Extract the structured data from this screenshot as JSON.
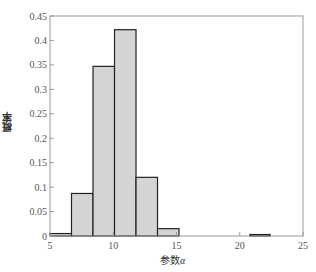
{
  "chart_data": {
    "type": "bar",
    "subtype": "histogram",
    "title": "",
    "xlabel": "参数",
    "xlabel_symbol": "α",
    "ylabel": "概率",
    "xlim": [
      5,
      25
    ],
    "ylim": [
      0,
      0.45
    ],
    "xticks": [
      5,
      10,
      15,
      20,
      25
    ],
    "yticks": [
      0,
      0.05,
      0.1,
      0.15,
      0.2,
      0.25,
      0.3,
      0.35,
      0.4,
      0.45
    ],
    "ytick_labels": [
      "0",
      "0.05",
      "0.1",
      "0.15",
      "0.2",
      "0.25",
      "0.3",
      "0.35",
      "0.4",
      "0.45"
    ],
    "grid": false,
    "legend": null,
    "bin_edges": [
      5,
      6.7,
      8.4,
      10.1,
      11.8,
      13.5,
      15.2,
      20.8,
      22.4
    ],
    "bins": [
      {
        "x0": 5.0,
        "x1": 6.7,
        "value": 0.005
      },
      {
        "x0": 6.7,
        "x1": 8.4,
        "value": 0.087
      },
      {
        "x0": 8.4,
        "x1": 10.1,
        "value": 0.347
      },
      {
        "x0": 10.1,
        "x1": 11.8,
        "value": 0.422
      },
      {
        "x0": 11.8,
        "x1": 13.5,
        "value": 0.12
      },
      {
        "x0": 13.5,
        "x1": 15.2,
        "value": 0.015
      },
      {
        "x0": 20.8,
        "x1": 22.4,
        "value": 0.003
      }
    ],
    "bar_fill": "#d4d4d4",
    "bar_edge": "#222222",
    "axis_color": "#999999"
  },
  "labels": {
    "ylabel": "概率",
    "xlabel_text": "参数",
    "xlabel_symbol": "α"
  }
}
